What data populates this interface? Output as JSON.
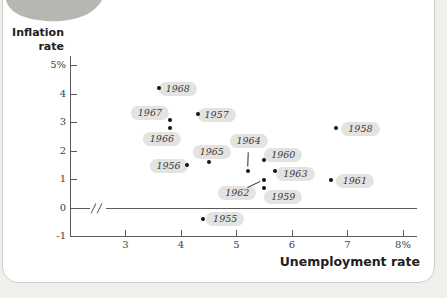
{
  "figure": {
    "y_axis_title_line1": "Inflation",
    "y_axis_title_line2": "rate",
    "x_axis_title": "Unemployment rate"
  },
  "colors": {
    "axis": "#5a5b5d",
    "tick_text": "#3d3e40",
    "title_text": "#1f2021",
    "dot": "#141414",
    "pill_bg": "#e3e4e1",
    "pill_text": "#3a3a38",
    "panel_border": "#cdcfc9",
    "page_bg": "#eff0ec",
    "corner_shape": "#b5b8b2",
    "leader_line": "#2a2a2a"
  },
  "chart_data": {
    "type": "scatter",
    "title": "",
    "xlabel": "Unemployment rate",
    "ylabel": "Inflation rate",
    "xlim": [
      2,
      8.3
    ],
    "ylim": [
      -1,
      5.3
    ],
    "grid": false,
    "axis_break_on_zero_line": true,
    "x_ticks": [
      {
        "value": 3,
        "label": "3"
      },
      {
        "value": 4,
        "label": "4"
      },
      {
        "value": 5,
        "label": "5"
      },
      {
        "value": 6,
        "label": "6"
      },
      {
        "value": 7,
        "label": "7"
      },
      {
        "value": 8,
        "label": "8%"
      }
    ],
    "y_ticks": [
      {
        "value": 5,
        "label": "5%"
      },
      {
        "value": 4,
        "label": "4"
      },
      {
        "value": 3,
        "label": "3"
      },
      {
        "value": 2,
        "label": "2"
      },
      {
        "value": 1,
        "label": "1"
      },
      {
        "value": 0,
        "label": "0"
      },
      {
        "value": -1,
        "label": "-1"
      }
    ],
    "points": [
      {
        "year": "1955",
        "unemployment": 4.4,
        "inflation": -0.4,
        "label_dx": 22,
        "label_dy": 0,
        "leader": false
      },
      {
        "year": "1956",
        "unemployment": 4.1,
        "inflation": 1.5,
        "label_dx": -18,
        "label_dy": 1,
        "leader": false
      },
      {
        "year": "1957",
        "unemployment": 4.3,
        "inflation": 3.3,
        "label_dx": 19,
        "label_dy": 1,
        "leader": false
      },
      {
        "year": "1958",
        "unemployment": 6.8,
        "inflation": 2.8,
        "label_dx": 24,
        "label_dy": 1,
        "leader": false
      },
      {
        "year": "1959",
        "unemployment": 5.5,
        "inflation": 0.7,
        "label_dx": 19,
        "label_dy": 9,
        "leader": false
      },
      {
        "year": "1960",
        "unemployment": 5.5,
        "inflation": 1.7,
        "label_dx": 19,
        "label_dy": -5,
        "leader": false
      },
      {
        "year": "1961",
        "unemployment": 6.7,
        "inflation": 1.0,
        "label_dx": 24,
        "label_dy": 1.5,
        "leader": false
      },
      {
        "year": "1962",
        "unemployment": 5.5,
        "inflation": 1.0,
        "label_dx": -27,
        "label_dy": 13,
        "leader": true
      },
      {
        "year": "1963",
        "unemployment": 5.7,
        "inflation": 1.3,
        "label_dx": 20,
        "label_dy": 3,
        "leader": false
      },
      {
        "year": "1964",
        "unemployment": 5.2,
        "inflation": 1.3,
        "label_dx": 1,
        "label_dy": -30,
        "leader": true
      },
      {
        "year": "1965",
        "unemployment": 4.5,
        "inflation": 1.6,
        "label_dx": 3,
        "label_dy": -10,
        "leader": false
      },
      {
        "year": "1966",
        "unemployment": 3.8,
        "inflation": 2.8,
        "label_dx": -8,
        "label_dy": 11,
        "leader": false
      },
      {
        "year": "1967",
        "unemployment": 3.8,
        "inflation": 3.1,
        "label_dx": -20,
        "label_dy": -7,
        "leader": false
      },
      {
        "year": "1968",
        "unemployment": 3.6,
        "inflation": 4.2,
        "label_dx": 19,
        "label_dy": 0.5,
        "leader": false
      }
    ]
  }
}
